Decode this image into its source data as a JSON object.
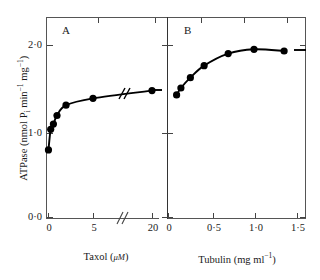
{
  "chart_data": {
    "type": "scatter",
    "title": "",
    "ylabel": "ATPase (nmol Pi min-1 mg-1)",
    "ylim": [
      0.0,
      2.4
    ],
    "yticks": [
      "0·0",
      "1·0",
      "2·0"
    ],
    "ytick_values": [
      0.0,
      1.0,
      2.0
    ],
    "grid": false,
    "legend": false,
    "panels": [
      {
        "letter": "A",
        "xlabel": "Taxol (μM)",
        "xlabel_parts": {
          "name": "Taxol",
          "unit_open": "(",
          "unit_symbol": "μM",
          "unit_close": ")"
        },
        "xticks": [
          "0",
          "5",
          "20"
        ],
        "xtick_values": [
          0,
          5,
          20
        ],
        "xlim": [
          0,
          22
        ],
        "axis_break": true,
        "axis_break_at": 8.5,
        "x": [
          0.05,
          0.3,
          0.6,
          1.0,
          2.0,
          5.0,
          20.0
        ],
        "y": [
          0.78,
          1.02,
          1.08,
          1.18,
          1.3,
          1.38,
          1.47
        ]
      },
      {
        "letter": "B",
        "xlabel": "Tubulin (mg ml-1)",
        "xlabel_parts": {
          "name": "Tubulin",
          "unit_open": "(",
          "unit_symbol": "mg ml",
          "unit_exp": "−1",
          "unit_close": ")"
        },
        "xticks": [
          "0",
          "0·5",
          "1·0",
          "1·5"
        ],
        "xtick_values": [
          0,
          0.5,
          1.0,
          1.5
        ],
        "xlim": [
          0,
          1.62
        ],
        "axis_break": false,
        "x": [
          0.1,
          0.15,
          0.26,
          0.42,
          0.7,
          1.0,
          1.35
        ],
        "y": [
          1.42,
          1.5,
          1.62,
          1.76,
          1.9,
          1.95,
          1.93
        ]
      }
    ]
  },
  "labels": {
    "ylabel_text": "ATPase (nmol P",
    "ylabel_sub": "i",
    "ylabel_mid": " min",
    "ylabel_exp1": "−1",
    "ylabel_mid2": " mg",
    "ylabel_exp2": "−1",
    "ylabel_close": ")",
    "panel_a_letter": "A",
    "panel_b_letter": "B",
    "y_tick_0": "0·0",
    "y_tick_1": "1·0",
    "y_tick_2": "2·0",
    "a_tick_0": "0",
    "a_tick_5": "5",
    "a_tick_20": "20",
    "b_tick_0": "0",
    "b_tick_05": "0·5",
    "b_tick_10": "1·0",
    "b_tick_15": "1·5",
    "a_xlabel_name": "Taxol",
    "a_xlabel_unit": "μM",
    "b_xlabel_name": "Tubulin",
    "b_xlabel_unit": "mg ml",
    "paren_open": "(",
    "paren_close": ")",
    "exp_minus_one": "−1"
  },
  "colors": {
    "axis": "#555555",
    "marker": "#000000",
    "curve": "#000000",
    "background": "#ffffff"
  }
}
